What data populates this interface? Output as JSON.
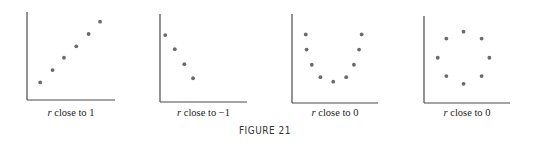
{
  "chart_data": [
    {
      "type": "scatter",
      "title": "",
      "caption_var": "r",
      "caption": " close to 1",
      "xlabel": "",
      "ylabel": "",
      "xlim": [
        0,
        10
      ],
      "ylim": [
        0,
        10
      ],
      "grid": false,
      "points": [
        [
          1.5,
          2.0
        ],
        [
          2.9,
          3.4
        ],
        [
          4.2,
          4.8
        ],
        [
          5.6,
          6.1
        ],
        [
          7.0,
          7.5
        ],
        [
          8.3,
          8.9
        ]
      ]
    },
    {
      "type": "scatter",
      "title": "",
      "caption_var": "r",
      "caption": " close to −1",
      "xlabel": "",
      "ylabel": "",
      "xlim": [
        0,
        10
      ],
      "ylim": [
        0,
        10
      ],
      "grid": false,
      "points": [
        [
          0.6,
          7.6
        ],
        [
          1.7,
          6.0
        ],
        [
          2.8,
          4.3
        ],
        [
          3.8,
          2.7
        ]
      ]
    },
    {
      "type": "scatter",
      "title": "",
      "caption_var": "r",
      "caption": " close to 0",
      "xlabel": "",
      "ylabel": "",
      "xlim": [
        0,
        10
      ],
      "ylim": [
        0,
        10
      ],
      "grid": false,
      "points": [
        [
          1.6,
          7.7
        ],
        [
          1.7,
          6.0
        ],
        [
          2.3,
          4.3
        ],
        [
          3.3,
          2.9
        ],
        [
          4.8,
          2.4
        ],
        [
          6.3,
          2.9
        ],
        [
          7.2,
          4.3
        ],
        [
          7.8,
          6.0
        ],
        [
          8.1,
          7.7
        ]
      ]
    },
    {
      "type": "scatter",
      "title": "",
      "caption_var": "r",
      "caption": " close to 0",
      "xlabel": "",
      "ylabel": "",
      "xlim": [
        0,
        10
      ],
      "ylim": [
        0,
        10
      ],
      "grid": false,
      "points": [
        [
          4.6,
          8.2
        ],
        [
          2.6,
          7.4
        ],
        [
          6.7,
          7.4
        ],
        [
          1.6,
          5.2
        ],
        [
          7.6,
          5.2
        ],
        [
          2.6,
          3.1
        ],
        [
          6.7,
          3.1
        ],
        [
          4.6,
          2.2
        ]
      ]
    }
  ],
  "figure_label": "FIGURE 21"
}
